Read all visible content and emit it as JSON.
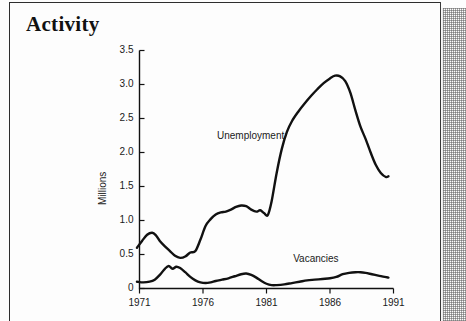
{
  "page": {
    "title": "Activity"
  },
  "chart_data": {
    "type": "line",
    "title": "Activity",
    "xlabel": "",
    "ylabel": "Millions",
    "xlim": [
      1971,
      1991
    ],
    "ylim": [
      0,
      3.5
    ],
    "grid": false,
    "legend_position": "inline-annotation",
    "xticks": [
      "1971",
      "1976",
      "1981",
      "1986",
      "1991"
    ],
    "xtick_values": [
      1971,
      1976,
      1981,
      1986,
      1991
    ],
    "yticks": [
      "0",
      "0.5",
      "1.0",
      "1.5",
      "2.0",
      "2.5",
      "3.0",
      "3.5"
    ],
    "ytick_values": [
      0,
      0.5,
      1.0,
      1.5,
      2.0,
      2.5,
      3.0,
      3.5
    ],
    "annotations": [
      {
        "text": "Unemployment",
        "x": 1977.1,
        "y": 2.23
      },
      {
        "text": "Vacancies",
        "x": 1983.1,
        "y": 0.42
      }
    ],
    "series": [
      {
        "name": "Unemployment",
        "color": "#111111",
        "x": [
          1970.8,
          1971.2,
          1971.6,
          1972.0,
          1972.3,
          1972.6,
          1973.0,
          1973.4,
          1973.8,
          1974.2,
          1974.6,
          1975.0,
          1975.4,
          1975.8,
          1976.2,
          1976.6,
          1977.0,
          1977.4,
          1977.8,
          1978.2,
          1978.6,
          1979.0,
          1979.4,
          1979.8,
          1980.2,
          1980.5,
          1980.8,
          1981.1,
          1981.4,
          1981.8,
          1982.2,
          1982.6,
          1983.0,
          1983.5,
          1984.0,
          1984.5,
          1985.0,
          1985.5,
          1986.0,
          1986.4,
          1986.8,
          1987.2,
          1987.6,
          1988.0,
          1988.4,
          1988.8,
          1989.2,
          1989.6,
          1990.0,
          1990.4,
          1990.6
        ],
        "y": [
          0.6,
          0.7,
          0.79,
          0.82,
          0.78,
          0.7,
          0.62,
          0.55,
          0.48,
          0.45,
          0.47,
          0.53,
          0.55,
          0.72,
          0.92,
          1.02,
          1.09,
          1.12,
          1.13,
          1.16,
          1.2,
          1.22,
          1.21,
          1.16,
          1.13,
          1.15,
          1.11,
          1.08,
          1.28,
          1.7,
          2.05,
          2.3,
          2.46,
          2.6,
          2.72,
          2.83,
          2.93,
          3.02,
          3.09,
          3.13,
          3.12,
          3.05,
          2.88,
          2.62,
          2.38,
          2.2,
          2.0,
          1.82,
          1.7,
          1.64,
          1.65
        ]
      },
      {
        "name": "Vacancies",
        "color": "#111111",
        "x": [
          1970.8,
          1971.3,
          1971.8,
          1972.2,
          1972.6,
          1973.0,
          1973.3,
          1973.6,
          1973.9,
          1974.2,
          1974.6,
          1975.0,
          1975.4,
          1975.8,
          1976.2,
          1976.6,
          1977.0,
          1977.5,
          1978.0,
          1978.5,
          1979.0,
          1979.4,
          1979.8,
          1980.2,
          1980.6,
          1981.0,
          1981.4,
          1981.8,
          1982.4,
          1983.0,
          1983.6,
          1984.2,
          1984.8,
          1985.4,
          1986.0,
          1986.5,
          1987.0,
          1987.5,
          1988.0,
          1988.4,
          1988.8,
          1989.3,
          1989.8,
          1990.3,
          1990.6
        ],
        "y": [
          0.1,
          0.09,
          0.1,
          0.13,
          0.2,
          0.29,
          0.33,
          0.29,
          0.32,
          0.3,
          0.24,
          0.17,
          0.12,
          0.09,
          0.08,
          0.09,
          0.11,
          0.13,
          0.15,
          0.18,
          0.21,
          0.22,
          0.2,
          0.16,
          0.11,
          0.07,
          0.05,
          0.05,
          0.06,
          0.08,
          0.1,
          0.12,
          0.13,
          0.14,
          0.15,
          0.17,
          0.21,
          0.23,
          0.24,
          0.24,
          0.23,
          0.21,
          0.19,
          0.17,
          0.16
        ]
      }
    ]
  }
}
